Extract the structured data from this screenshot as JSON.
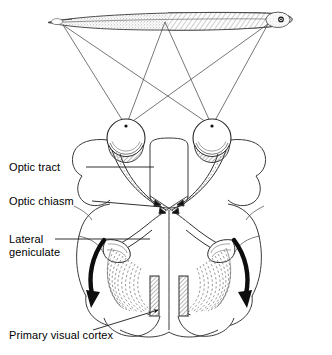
{
  "figure": {
    "type": "anatomical-schematic",
    "view": "superior (horizontal section) view of brain with visual field bar above"
  },
  "labels": {
    "optic_tract": "Optic tract",
    "optic_chiasm": "Optic chiasm",
    "lateral_geniculate_line1": "Lateral",
    "lateral_geniculate_line2": "geniculate",
    "primary_visual_cortex": "Primary visual cortex"
  },
  "colors": {
    "ink": "#1a1a1a",
    "line": "#3a3a3a",
    "hair": "#6b6b6b",
    "fiber": "#555555",
    "fill": "#ffffff",
    "stipple": "#b9b9b9",
    "hatch": "#9a9a9a",
    "background": "#ffffff"
  },
  "visual_field_bar": {
    "name": "visual-field-bar",
    "left_tip_x": 48,
    "right_tip_x": 292,
    "center_y": 22,
    "fixation_point_x": 278,
    "shading": "stippled left half, diagonal hatch right half"
  },
  "ray_origins": [
    63,
    165,
    268
  ],
  "eyes": [
    {
      "name": "left-eye",
      "cx": 126,
      "cy": 138,
      "r": 19,
      "nodal_x": 126,
      "nodal_y": 126
    },
    {
      "name": "right-eye",
      "cx": 212,
      "cy": 138,
      "r": 19,
      "nodal_x": 212,
      "nodal_y": 126
    }
  ],
  "chiasm": {
    "cx": 169,
    "cy": 208
  },
  "arrows": [
    {
      "name": "left-radiation-arrow",
      "direction": "down-left"
    },
    {
      "name": "right-radiation-arrow",
      "direction": "down-right"
    }
  ],
  "leader_lines": [
    {
      "name": "leader-optic-tract",
      "from_x": 86,
      "from_y": 167,
      "to_x": 154,
      "to_y": 167
    },
    {
      "name": "leader-optic-chiasm",
      "from_x": 92,
      "from_y": 201,
      "to_x": 162,
      "to_y": 208
    },
    {
      "name": "leader-lateral-geniculate",
      "from_x": 55,
      "from_y": 239,
      "to_x": 150,
      "to_y": 239
    },
    {
      "name": "leader-primary-visual-cortex",
      "from_x": 93,
      "from_y": 330,
      "to_x": 158,
      "to_y": 310
    }
  ]
}
